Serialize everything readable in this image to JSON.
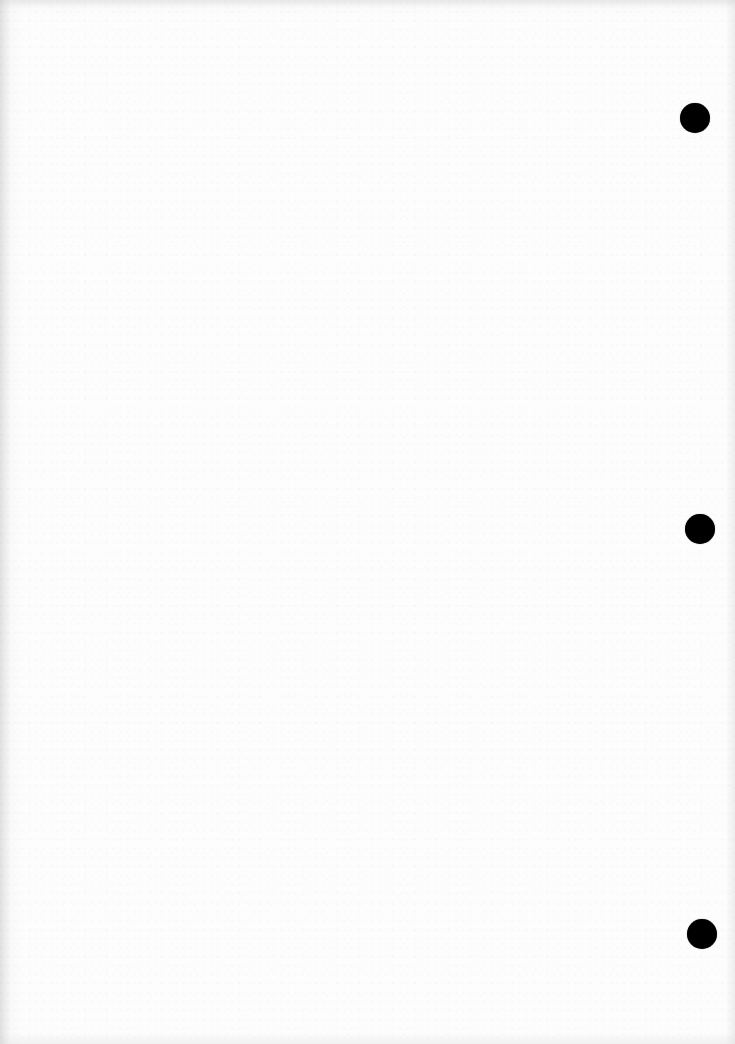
{
  "document": {
    "type": "blank scanned page",
    "content": "",
    "background_color": "#fdfdfd",
    "punch_holes": [
      {
        "position": "top",
        "cx": 695,
        "cy": 118,
        "diameter": 30,
        "color": "#000000"
      },
      {
        "position": "middle",
        "cx": 700,
        "cy": 529,
        "diameter": 30,
        "color": "#000000"
      },
      {
        "position": "bottom",
        "cx": 702,
        "cy": 934,
        "diameter": 30,
        "color": "#000000"
      }
    ]
  }
}
